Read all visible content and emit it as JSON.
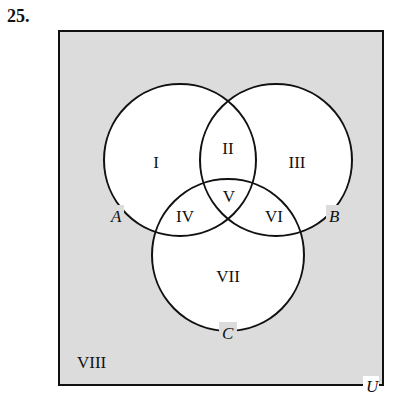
{
  "problem_number": "25.",
  "diagram": {
    "type": "venn",
    "universe_label": "U",
    "sets": [
      {
        "name": "A",
        "label": "A"
      },
      {
        "name": "B",
        "label": "B"
      },
      {
        "name": "C",
        "label": "C"
      }
    ],
    "regions": [
      {
        "id": "I",
        "label": "I",
        "description": "A only"
      },
      {
        "id": "II",
        "label": "II",
        "description": "A and B, not C"
      },
      {
        "id": "III",
        "label": "III",
        "description": "B only"
      },
      {
        "id": "IV",
        "label": "IV",
        "description": "A and C, not B"
      },
      {
        "id": "V",
        "label": "V",
        "description": "A, B and C"
      },
      {
        "id": "VI",
        "label": "VI",
        "description": "B and C, not A"
      },
      {
        "id": "VII",
        "label": "VII",
        "description": "C only"
      },
      {
        "id": "VIII",
        "label": "VIII",
        "description": "outside A, B, C"
      }
    ],
    "colors": {
      "universe_fill": "#dcdcdc",
      "circle_fill": "#ffffff",
      "stroke": "#111111"
    }
  }
}
